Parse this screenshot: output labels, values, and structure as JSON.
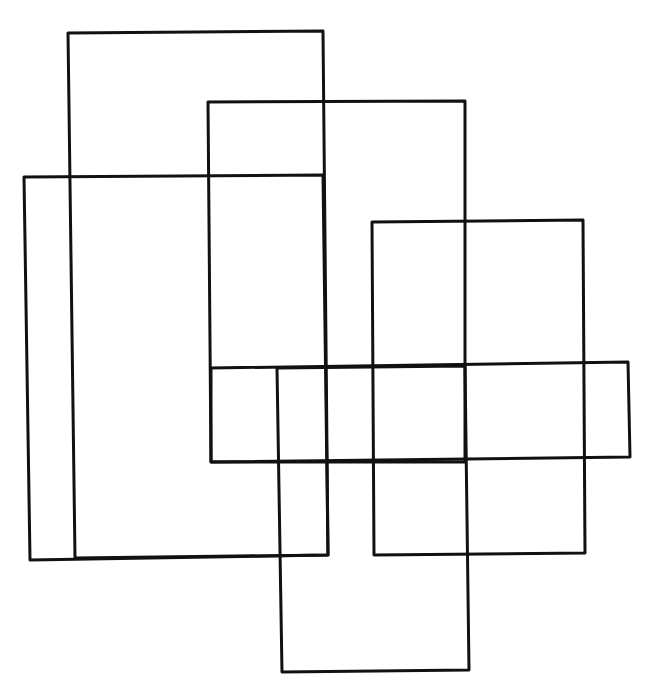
{
  "diagram": {
    "title": "",
    "stroke_color": "#111111",
    "background": "#ffffff",
    "rectangles": [
      {
        "id": "tall-left",
        "points": "68,33 323,31 328,555 75,558"
      },
      {
        "id": "wide-left",
        "points": "24,177 323,175 328,555 30,560"
      },
      {
        "id": "upper-middle",
        "points": "208,102 465,101 465,462 211,462"
      },
      {
        "id": "right",
        "points": "372,222 583,220 585,553 374,555"
      },
      {
        "id": "horizontal-band",
        "points": "211,368 628,362 630,457 211,462"
      },
      {
        "id": "bottom-middle",
        "points": "277,368 465,366 469,670 282,672"
      }
    ]
  }
}
